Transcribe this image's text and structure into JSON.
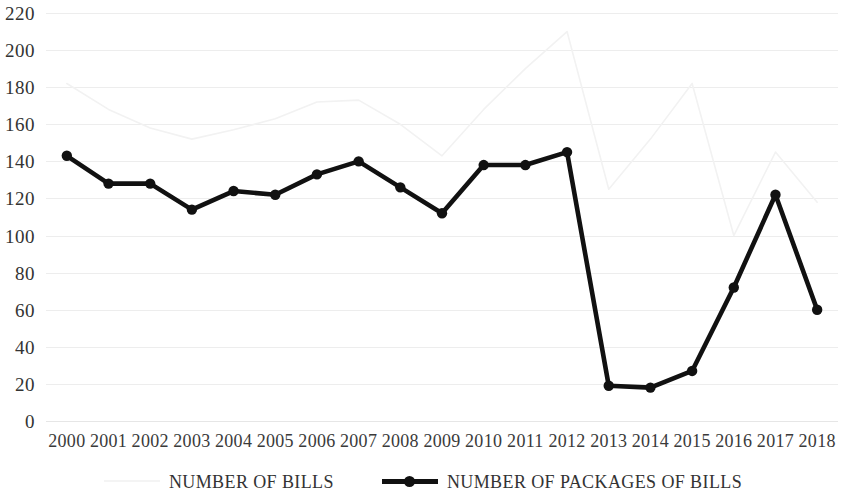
{
  "chart_data": {
    "type": "line",
    "title": "",
    "xlabel": "",
    "ylabel": "",
    "ylim": [
      0,
      220
    ],
    "ytick_step": 20,
    "grid": true,
    "legend_position": "bottom",
    "categories": [
      "2000",
      "2001",
      "2002",
      "2003",
      "2004",
      "2005",
      "2006",
      "2007",
      "2008",
      "2009",
      "2010",
      "2011",
      "2012",
      "2013",
      "2014",
      "2015",
      "2016",
      "2017",
      "2018"
    ],
    "yticks": [
      "0",
      "20",
      "40",
      "60",
      "80",
      "100",
      "120",
      "140",
      "160",
      "180",
      "200",
      "220"
    ],
    "series": [
      {
        "name": "NUMBER OF BILLS",
        "color": "#f2f2f2",
        "marker": "none",
        "values": [
          182,
          168,
          158,
          152,
          157,
          163,
          172,
          173,
          160,
          143,
          168,
          190,
          210,
          125,
          152,
          182,
          100,
          145,
          118
        ]
      },
      {
        "name": "NUMBER OF PACKAGES OF BILLS",
        "color": "#111111",
        "marker": "circle",
        "values": [
          143,
          128,
          128,
          114,
          124,
          122,
          133,
          140,
          126,
          112,
          138,
          138,
          145,
          19,
          18,
          27,
          72,
          122,
          60
        ]
      }
    ]
  },
  "legend": {
    "items": [
      {
        "label": "NUMBER OF BILLS",
        "style": "faint"
      },
      {
        "label": "NUMBER OF PACKAGES OF BILLS",
        "style": "bold"
      }
    ]
  },
  "colors": {
    "gridline": "#ededed",
    "bills_line": "#f2f2f2",
    "packages_line": "#111111",
    "axis_text": "#333333"
  }
}
